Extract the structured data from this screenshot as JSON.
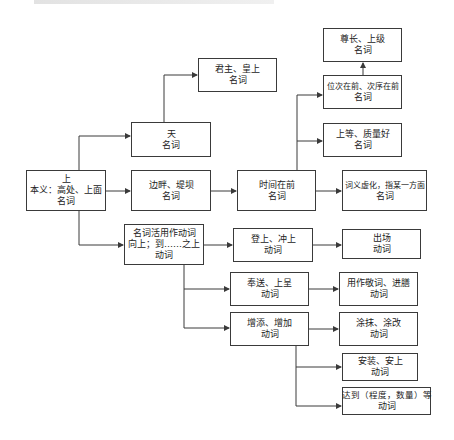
{
  "diagram": {
    "title_strip": "",
    "nodes": {
      "root": {
        "lines": [
          "上",
          "本义：高处、上面",
          "名词"
        ]
      },
      "tian": {
        "lines": [
          "天",
          "名词"
        ]
      },
      "junzhu": {
        "lines": [
          "君主、皇上",
          "名词"
        ]
      },
      "bianpan": {
        "lines": [
          "边畔、堤坝",
          "名词"
        ]
      },
      "shijian": {
        "lines": [
          "时间在前",
          "名词"
        ]
      },
      "weici": {
        "lines": [
          "位次在前、次序在前",
          "名词"
        ]
      },
      "zunzhang": {
        "lines": [
          "尊长、上级",
          "名词"
        ]
      },
      "shangdeng": {
        "lines": [
          "上等、质量好",
          "名词"
        ]
      },
      "ciyi": {
        "lines": [
          "词义虚化，指某一方面",
          "名词"
        ]
      },
      "huoyong": {
        "lines": [
          "名词活用作动词",
          "向上；到……之上",
          "动词"
        ]
      },
      "dengshang": {
        "lines": [
          "登上、冲上",
          "动词"
        ]
      },
      "chuchang": {
        "lines": [
          "出场",
          "动词"
        ]
      },
      "fengsong": {
        "lines": [
          "奉送、上呈",
          "动词"
        ]
      },
      "jingci": {
        "lines": [
          "用作敬词、进膳",
          "动词"
        ]
      },
      "zengtian": {
        "lines": [
          "增添、增加",
          "动词"
        ]
      },
      "tumo": {
        "lines": [
          "涂抹、涂改",
          "动词"
        ]
      },
      "anzhuang": {
        "lines": [
          "安装、安上",
          "动词"
        ]
      },
      "dadao": {
        "lines": [
          "达到（程度，数量）等",
          "动词"
        ]
      }
    },
    "edges": [
      [
        "root",
        "tian"
      ],
      [
        "root",
        "bianpan"
      ],
      [
        "root",
        "huoyong"
      ],
      [
        "tian",
        "junzhu"
      ],
      [
        "bianpan",
        "shijian"
      ],
      [
        "shijian",
        "weici"
      ],
      [
        "shijian",
        "shangdeng"
      ],
      [
        "shijian",
        "ciyi"
      ],
      [
        "weici",
        "zunzhang"
      ],
      [
        "huoyong",
        "dengshang"
      ],
      [
        "huoyong",
        "fengsong"
      ],
      [
        "huoyong",
        "zengtian"
      ],
      [
        "dengshang",
        "chuchang"
      ],
      [
        "fengsong",
        "jingci"
      ],
      [
        "zengtian",
        "tumo"
      ],
      [
        "zengtian",
        "anzhuang"
      ],
      [
        "zengtian",
        "dadao"
      ]
    ],
    "colors": {
      "stroke": "#3a3a3a",
      "background": "#ffffff",
      "text": "#222222"
    }
  }
}
